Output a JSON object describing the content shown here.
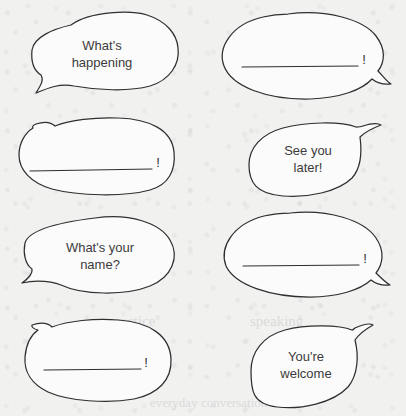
{
  "page": {
    "background_color": "#f1f1f0",
    "ink_color": "#2f2f31",
    "bubble_fill": "#fbfbfb",
    "width": 406,
    "height": 416
  },
  "faint_show_through": [
    {
      "text": "practice",
      "x": 108,
      "y": 322,
      "size": 15
    },
    {
      "text": "speaking",
      "x": 250,
      "y": 322,
      "size": 15
    },
    {
      "text": "greetings",
      "x": 120,
      "y": 356,
      "size": 14
    },
    {
      "text": "and replies",
      "x": 255,
      "y": 356,
      "size": 14
    },
    {
      "text": "everyday conversation",
      "x": 150,
      "y": 404,
      "size": 13
    }
  ],
  "bubbles": [
    {
      "id": "bubble-1",
      "position": "top-left",
      "kind": "text",
      "tail_direction": "down-left",
      "lines": [
        "What's",
        "happening"
      ],
      "blank_line": false,
      "punctuation": ""
    },
    {
      "id": "bubble-2",
      "position": "top-right",
      "kind": "blank",
      "tail_direction": "down-right",
      "lines": [],
      "blank_line": true,
      "punctuation": "!"
    },
    {
      "id": "bubble-3",
      "position": "second-left",
      "kind": "blank",
      "tail_direction": "up-left",
      "lines": [],
      "blank_line": true,
      "punctuation": "!"
    },
    {
      "id": "bubble-4",
      "position": "second-right",
      "kind": "text",
      "tail_direction": "up-right",
      "lines": [
        "See you",
        "later!"
      ],
      "blank_line": false,
      "punctuation": ""
    },
    {
      "id": "bubble-5",
      "position": "third-left",
      "kind": "text",
      "tail_direction": "down-left",
      "lines": [
        "What's your",
        "name?"
      ],
      "blank_line": false,
      "punctuation": ""
    },
    {
      "id": "bubble-6",
      "position": "third-right",
      "kind": "blank",
      "tail_direction": "down-right",
      "lines": [],
      "blank_line": true,
      "punctuation": "!"
    },
    {
      "id": "bubble-7",
      "position": "bottom-left",
      "kind": "blank",
      "tail_direction": "up-left",
      "lines": [],
      "blank_line": true,
      "punctuation": "!"
    },
    {
      "id": "bubble-8",
      "position": "bottom-right",
      "kind": "text",
      "tail_direction": "up-right",
      "lines": [
        "You're",
        "welcome"
      ],
      "blank_line": false,
      "punctuation": ""
    }
  ]
}
